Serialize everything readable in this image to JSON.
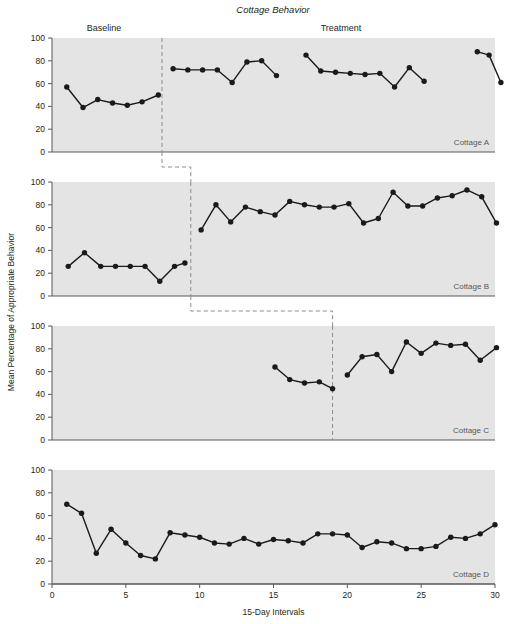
{
  "figure": {
    "title": "Cottage Behavior",
    "xlabel": "15-Day Intervals",
    "ylabel": "Mean Percentage of Appropriate Behavior",
    "phase_labels": {
      "baseline": "Baseline",
      "treatment": "Treatment"
    },
    "caption": "",
    "colors": {
      "panel_background": "#e4e4e4",
      "axis": "#58595b",
      "marker": "#1a1a1a",
      "line": "#1a1a1a",
      "phase_line": "#8c8c8c",
      "panel_label": "#58595b"
    }
  },
  "chart_data": {
    "type": "line",
    "title": "Cottage Behavior",
    "xlabel": "15-Day Intervals",
    "ylabel": "Mean Percentage of Appropriate Behavior",
    "xlim": [
      0,
      30
    ],
    "ylim": [
      0,
      100
    ],
    "xticks": [
      0,
      5,
      10,
      15,
      20,
      25,
      30
    ],
    "yticks": [
      0,
      20,
      40,
      60,
      80,
      100
    ],
    "grid": false,
    "legend": "none",
    "design": "multiple-baseline across settings",
    "panels": [
      {
        "name": "Cottage A",
        "label": "Cottage A",
        "phase_line_x": 7.45,
        "segments": [
          {
            "phase": "Baseline",
            "x": [
              1.0,
              2.1,
              3.1,
              4.1,
              5.1,
              6.1,
              7.2
            ],
            "y": [
              57,
              39,
              46,
              43,
              41,
              44,
              50
            ]
          },
          {
            "phase": "Treatment",
            "x": [
              8.2,
              9.2,
              10.2,
              11.2,
              12.2,
              13.2,
              14.2,
              15.2
            ],
            "y": [
              73,
              72,
              72,
              72,
              61,
              79,
              80,
              67
            ]
          },
          {
            "phase": "Treatment",
            "x": [
              17.2,
              18.2,
              19.2,
              20.2,
              21.2,
              22.2,
              23.2,
              24.2,
              25.2
            ],
            "y": [
              85,
              71,
              70,
              69,
              68,
              69,
              57,
              74,
              62
            ]
          },
          {
            "phase": "Treatment",
            "x": [
              28.8,
              29.6,
              30.4
            ],
            "y": [
              88,
              85,
              61
            ]
          }
        ]
      },
      {
        "name": "Cottage B",
        "label": "Cottage B",
        "phase_line_x": 9.4,
        "segments": [
          {
            "phase": "Baseline",
            "x": [
              1.1,
              2.2,
              3.3,
              4.3,
              5.3,
              6.3,
              7.3,
              8.3,
              9.0
            ],
            "y": [
              26,
              38,
              26,
              26,
              26,
              26,
              13,
              26,
              29
            ]
          },
          {
            "phase": "Treatment",
            "x": [
              10.1,
              11.1,
              12.1,
              13.1,
              14.1,
              15.1,
              16.1,
              17.1,
              18.1,
              19.1,
              20.1,
              21.1,
              22.1,
              23.1,
              24.1,
              25.1,
              26.1,
              27.1,
              28.1,
              29.1,
              30.1
            ],
            "y": [
              58,
              80,
              65,
              78,
              74,
              71,
              83,
              80,
              78,
              78,
              81,
              64,
              68,
              91,
              79,
              79,
              86,
              88,
              93,
              87,
              64
            ]
          }
        ]
      },
      {
        "name": "Cottage C",
        "label": "Cottage C",
        "phase_line_x": 19.0,
        "segments": [
          {
            "phase": "Baseline",
            "x": [
              15.1,
              16.1,
              17.1,
              18.1,
              19.0
            ],
            "y": [
              64,
              53,
              50,
              51,
              45
            ]
          },
          {
            "phase": "Treatment",
            "x": [
              20.0,
              21.0,
              22.0,
              23.0,
              24.0,
              25.0,
              26.0,
              27.0,
              28.0,
              29.0,
              30.1
            ],
            "y": [
              57,
              73,
              75,
              60,
              86,
              76,
              85,
              83,
              84,
              70,
              81
            ]
          }
        ]
      },
      {
        "name": "Cottage D",
        "label": "Cottage D",
        "phase_line_x": null,
        "segments": [
          {
            "phase": "Baseline",
            "x": [
              1.0,
              2.0,
              3.0,
              4.0,
              5.0,
              6.0,
              7.0,
              8.0,
              9.0,
              10.0,
              11.0,
              12.0,
              13.0,
              14.0,
              15.0,
              16.0,
              17.0,
              18.0,
              19.0,
              20.0,
              21.0,
              22.0,
              23.0,
              24.0,
              25.0,
              26.0,
              27.0,
              28.0,
              29.0,
              30.0
            ],
            "y": [
              70,
              62,
              27,
              48,
              36,
              25,
              22,
              45,
              43,
              41,
              36,
              35,
              40,
              35,
              39,
              38,
              36,
              44,
              44,
              43,
              32,
              37,
              36,
              31,
              31,
              33,
              41,
              40,
              44,
              52
            ]
          }
        ]
      }
    ]
  }
}
